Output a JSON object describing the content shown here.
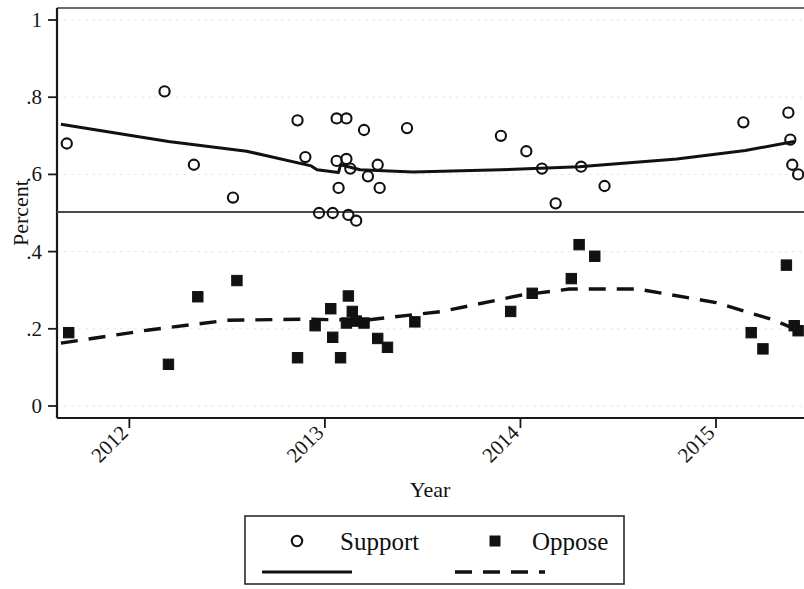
{
  "chart_data": {
    "type": "scatter",
    "title": "",
    "xlabel": "Year",
    "ylabel": "Percent",
    "xlim": [
      2011.63,
      2015.45
    ],
    "ylim": [
      0,
      1
    ],
    "grid": true,
    "legend_position": "bottom",
    "reference_line": {
      "y": 0.5,
      "label": ""
    },
    "x_ticks": [
      "2012",
      "2013",
      "2014",
      "2015"
    ],
    "x_tick_values": [
      2012,
      2013,
      2014,
      2015
    ],
    "y_ticks": [
      "0",
      ".2",
      ".4",
      ".6",
      ".8",
      "1"
    ],
    "y_tick_values": [
      0,
      0.2,
      0.4,
      0.6,
      0.8,
      1
    ],
    "series": [
      {
        "name": "Support",
        "marker": "open-circle",
        "line_style": "solid",
        "points": [
          {
            "x": 2011.68,
            "y": 0.68
          },
          {
            "x": 2012.18,
            "y": 0.815
          },
          {
            "x": 2012.33,
            "y": 0.625
          },
          {
            "x": 2012.53,
            "y": 0.54
          },
          {
            "x": 2012.86,
            "y": 0.74
          },
          {
            "x": 2012.9,
            "y": 0.645
          },
          {
            "x": 2012.97,
            "y": 0.5
          },
          {
            "x": 2013.04,
            "y": 0.5
          },
          {
            "x": 2013.06,
            "y": 0.745
          },
          {
            "x": 2013.06,
            "y": 0.635
          },
          {
            "x": 2013.07,
            "y": 0.565
          },
          {
            "x": 2013.11,
            "y": 0.745
          },
          {
            "x": 2013.11,
            "y": 0.64
          },
          {
            "x": 2013.12,
            "y": 0.495
          },
          {
            "x": 2013.13,
            "y": 0.615
          },
          {
            "x": 2013.16,
            "y": 0.48
          },
          {
            "x": 2013.2,
            "y": 0.715
          },
          {
            "x": 2013.22,
            "y": 0.595
          },
          {
            "x": 2013.27,
            "y": 0.625
          },
          {
            "x": 2013.28,
            "y": 0.565
          },
          {
            "x": 2013.42,
            "y": 0.72
          },
          {
            "x": 2013.9,
            "y": 0.7
          },
          {
            "x": 2014.03,
            "y": 0.66
          },
          {
            "x": 2014.11,
            "y": 0.615
          },
          {
            "x": 2014.18,
            "y": 0.525
          },
          {
            "x": 2014.31,
            "y": 0.62
          },
          {
            "x": 2014.43,
            "y": 0.57
          },
          {
            "x": 2015.14,
            "y": 0.735
          },
          {
            "x": 2015.37,
            "y": 0.76
          },
          {
            "x": 2015.38,
            "y": 0.69
          },
          {
            "x": 2015.39,
            "y": 0.625
          },
          {
            "x": 2015.42,
            "y": 0.6
          }
        ],
        "fit_line": [
          {
            "x": 2011.65,
            "y": 0.73
          },
          {
            "x": 2012.2,
            "y": 0.685
          },
          {
            "x": 2012.6,
            "y": 0.66
          },
          {
            "x": 2012.93,
            "y": 0.622
          },
          {
            "x": 2012.96,
            "y": 0.612
          },
          {
            "x": 2013.07,
            "y": 0.605
          },
          {
            "x": 2013.08,
            "y": 0.625
          },
          {
            "x": 2013.18,
            "y": 0.612
          },
          {
            "x": 2013.45,
            "y": 0.606
          },
          {
            "x": 2013.9,
            "y": 0.612
          },
          {
            "x": 2014.3,
            "y": 0.62
          },
          {
            "x": 2014.8,
            "y": 0.64
          },
          {
            "x": 2015.15,
            "y": 0.662
          },
          {
            "x": 2015.4,
            "y": 0.685
          }
        ]
      },
      {
        "name": "Oppose",
        "marker": "filled-square",
        "line_style": "dashed",
        "points": [
          {
            "x": 2011.69,
            "y": 0.19
          },
          {
            "x": 2012.2,
            "y": 0.108
          },
          {
            "x": 2012.35,
            "y": 0.283
          },
          {
            "x": 2012.55,
            "y": 0.325
          },
          {
            "x": 2012.86,
            "y": 0.125
          },
          {
            "x": 2012.95,
            "y": 0.208
          },
          {
            "x": 2013.03,
            "y": 0.252
          },
          {
            "x": 2013.04,
            "y": 0.178
          },
          {
            "x": 2013.08,
            "y": 0.125
          },
          {
            "x": 2013.11,
            "y": 0.215
          },
          {
            "x": 2013.12,
            "y": 0.285
          },
          {
            "x": 2013.14,
            "y": 0.245
          },
          {
            "x": 2013.16,
            "y": 0.22
          },
          {
            "x": 2013.2,
            "y": 0.215
          },
          {
            "x": 2013.27,
            "y": 0.175
          },
          {
            "x": 2013.32,
            "y": 0.152
          },
          {
            "x": 2013.46,
            "y": 0.218
          },
          {
            "x": 2013.95,
            "y": 0.245
          },
          {
            "x": 2014.06,
            "y": 0.292
          },
          {
            "x": 2014.26,
            "y": 0.33
          },
          {
            "x": 2014.3,
            "y": 0.418
          },
          {
            "x": 2014.38,
            "y": 0.388
          },
          {
            "x": 2015.18,
            "y": 0.19
          },
          {
            "x": 2015.24,
            "y": 0.148
          },
          {
            "x": 2015.36,
            "y": 0.365
          },
          {
            "x": 2015.4,
            "y": 0.208
          },
          {
            "x": 2015.42,
            "y": 0.195
          }
        ],
        "fit_line": [
          {
            "x": 2011.65,
            "y": 0.163
          },
          {
            "x": 2012.1,
            "y": 0.197
          },
          {
            "x": 2012.5,
            "y": 0.222
          },
          {
            "x": 2012.9,
            "y": 0.225
          },
          {
            "x": 2013.2,
            "y": 0.222
          },
          {
            "x": 2013.6,
            "y": 0.245
          },
          {
            "x": 2014.0,
            "y": 0.287
          },
          {
            "x": 2014.25,
            "y": 0.303
          },
          {
            "x": 2014.6,
            "y": 0.303
          },
          {
            "x": 2015.0,
            "y": 0.268
          },
          {
            "x": 2015.3,
            "y": 0.222
          },
          {
            "x": 2015.4,
            "y": 0.2
          }
        ]
      }
    ]
  },
  "legend": {
    "items": [
      {
        "label": "Support",
        "marker": "open-circle",
        "line_style": "solid"
      },
      {
        "label": "Oppose",
        "marker": "filled-square",
        "line_style": "dashed"
      }
    ]
  },
  "colors": {
    "ink": "#111111",
    "grid": "#e8e8e8",
    "frame": "#3a3a3a",
    "background": "#ffffff"
  }
}
